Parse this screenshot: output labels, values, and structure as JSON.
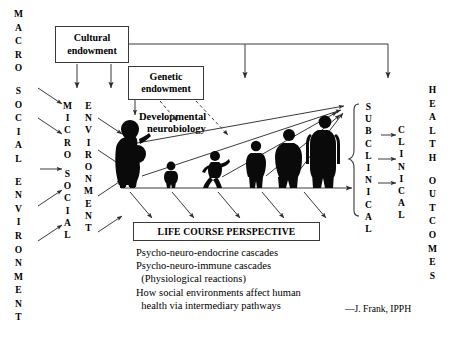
{
  "diagram": {
    "attribution": "—J. Frank, IPPH",
    "left_axis": {
      "name": "macro-social-environment",
      "words": [
        "MACRO",
        "SOCIAL",
        "ENVIRONMENT"
      ]
    },
    "micro_axis": {
      "name": "micro-social",
      "words": [
        "MICRO",
        "SOCIAL"
      ]
    },
    "micro_env_axis": {
      "name": "environment",
      "words": [
        "ENVIRONMENT"
      ]
    },
    "subclinical_axis": {
      "name": "subclinical",
      "words": [
        "SUBCLINICAL"
      ]
    },
    "clinical_axis": {
      "name": "clinical",
      "words": [
        "CLINICAL"
      ]
    },
    "outcomes_axis": {
      "name": "health-outcomes",
      "words": [
        "HEALTH",
        "OUTCOMES"
      ]
    },
    "boxes": [
      {
        "id": "cultural-endowment",
        "line1": "Cultural",
        "line2": "endowment"
      },
      {
        "id": "genetic-endowment",
        "line1": "Genetic",
        "line2": "endowment"
      }
    ],
    "developmental_label": {
      "line1": "Developmental",
      "line2": "neurobiology"
    },
    "life_course_box": {
      "label": "LIFE COURSE PERSPECTIVE"
    },
    "cascades": [
      "Psycho-neuro-endocrine cascades",
      "Psycho-neuro-immune cascades",
      "  (Physiological reactions)",
      "How social environments affect human",
      "  health via intermediary pathways"
    ],
    "figures": [
      {
        "id": "pregnant-woman-silhouette",
        "stage": "pregnancy"
      },
      {
        "id": "toddler-silhouette",
        "stage": "infancy"
      },
      {
        "id": "running-child-silhouette",
        "stage": "childhood"
      },
      {
        "id": "youth-silhouette",
        "stage": "adolescence"
      },
      {
        "id": "adult-silhouette",
        "stage": "adulthood"
      },
      {
        "id": "older-adult-silhouette",
        "stage": "later-life"
      }
    ],
    "colors": {
      "ink": "#000000",
      "line": "#3a3a3a",
      "background": "#ffffff"
    }
  }
}
